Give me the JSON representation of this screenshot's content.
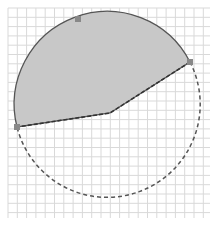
{
  "figure": {
    "colors": {
      "background": "#ffffff",
      "grid": "#d9d9d9",
      "shade_fill": "#c8c8c8",
      "outline": "#555555",
      "dashed": "#555555",
      "marker": "#888888"
    },
    "grid": {
      "x_start": 8,
      "x_end": 210,
      "y_start": 8,
      "y_end": 218,
      "spacing": 9.3
    },
    "circle": {
      "cx": 110,
      "cy": 118,
      "r": 93
    },
    "points": {
      "top_marker": {
        "x": 78,
        "y": 19
      },
      "right": {
        "x": 190,
        "y": 62
      },
      "left": {
        "x": 17,
        "y": 127
      },
      "inner": {
        "x": 110,
        "y": 113
      }
    }
  }
}
